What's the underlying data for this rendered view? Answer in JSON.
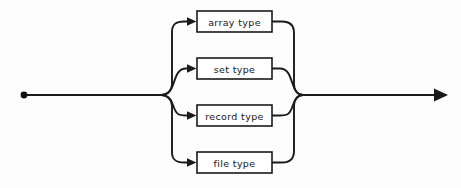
{
  "diagram": {
    "kind": "railroad-syntax-diagram",
    "background_color": "#fdfdfd",
    "line_color": "#1a1a1a",
    "box_fill_color": "#ffffff",
    "start_marker": {
      "name": "start-dot",
      "x": 24,
      "y": 95,
      "radius": 3.4
    },
    "end_marker": {
      "name": "end-arrow",
      "x": 447,
      "y": 95
    },
    "main_line_y": 95,
    "fork_x": 160,
    "merge_x": 300,
    "alternatives": [
      {
        "id": "array-type",
        "label": "array type",
        "box": {
          "x": 197,
          "y": 11,
          "width": 75,
          "height": 21
        },
        "center_y": 21.5
      },
      {
        "id": "set-type",
        "label": "set type",
        "box": {
          "x": 197,
          "y": 58,
          "width": 75,
          "height": 21
        },
        "center_y": 68.5
      },
      {
        "id": "record-type",
        "label": "record type",
        "box": {
          "x": 197,
          "y": 105,
          "width": 75,
          "height": 21
        },
        "center_y": 115.5
      },
      {
        "id": "file-type",
        "label": "file type",
        "box": {
          "x": 197,
          "y": 152,
          "width": 75,
          "height": 21
        },
        "center_y": 162.5
      }
    ]
  }
}
